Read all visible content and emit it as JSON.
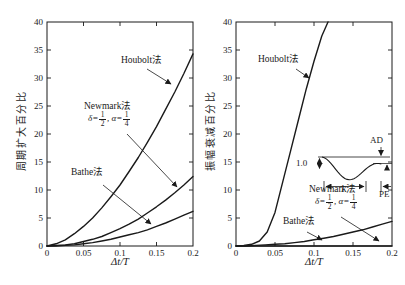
{
  "figure": {
    "bg": "#ffffff",
    "ink": "#1a1a1a",
    "width": 405,
    "height": 285
  },
  "labels": {
    "left": {
      "houbolt": "Houbolt法",
      "newmark": "Newmark法",
      "bathe": "Bathe法"
    },
    "right": {
      "houbolt": "Houbolt法",
      "newmark": "Newmark法",
      "bathe": "Bathe法"
    },
    "params": {
      "pre": "δ=",
      "f1n": "1",
      "f1d": "2",
      "mid": ", α=",
      "f2n": "1",
      "f2d": "4"
    }
  },
  "chart_data": [
    {
      "id": "period-elongation",
      "type": "line",
      "title": "",
      "xlabel": "Δt/T",
      "ylabel": "周期扩大百分比",
      "xlim": [
        0,
        0.2
      ],
      "ylim": [
        0,
        40
      ],
      "grid": false,
      "xticks": {
        "values": [
          0,
          0.05,
          0.1,
          0.15,
          0.2
        ],
        "labels": [
          "0",
          "0.05",
          "0.1",
          "0.15",
          "0.2"
        ]
      },
      "yticks": {
        "values": [
          0,
          5,
          10,
          15,
          20,
          25,
          30,
          35,
          40
        ],
        "labels": [
          "0",
          "5",
          "10",
          "15",
          "20",
          "25",
          "30",
          "35",
          "40"
        ]
      },
      "series": [
        {
          "key": "houbolt",
          "name": "Houbolt法",
          "x": [
            0,
            0.0125,
            0.025,
            0.0375,
            0.05,
            0.0625,
            0.075,
            0.0875,
            0.1,
            0.1125,
            0.125,
            0.1375,
            0.15,
            0.1625,
            0.175,
            0.1875,
            0.2
          ],
          "y": [
            0,
            0.4,
            1.1,
            2.2,
            3.5,
            5,
            6.8,
            8.8,
            10.9,
            13.3,
            15.8,
            18.5,
            21.3,
            24.4,
            27.5,
            30.8,
            34.3
          ]
        },
        {
          "key": "newmark",
          "name": "Newmark法 (δ=1/2, α=1/4)",
          "x": [
            0,
            0.0125,
            0.025,
            0.0375,
            0.05,
            0.0625,
            0.075,
            0.0875,
            0.1,
            0.1125,
            0.125,
            0.1375,
            0.15,
            0.1625,
            0.175,
            0.1875,
            0.2
          ],
          "y": [
            0,
            0.1,
            0.2,
            0.4,
            0.8,
            1.2,
            1.7,
            2.4,
            3.1,
            3.9,
            4.8,
            5.9,
            7,
            8.2,
            9.5,
            10.9,
            12.4
          ]
        },
        {
          "key": "bathe",
          "name": "Bathe法",
          "x": [
            0,
            0.0125,
            0.025,
            0.0375,
            0.05,
            0.0625,
            0.075,
            0.0875,
            0.1,
            0.1125,
            0.125,
            0.1375,
            0.15,
            0.1625,
            0.175,
            0.1875,
            0.2
          ],
          "y": [
            0,
            0,
            0.1,
            0.2,
            0.4,
            0.6,
            0.9,
            1.2,
            1.6,
            2,
            2.4,
            2.9,
            3.5,
            4.1,
            4.8,
            5.5,
            6.2
          ]
        }
      ],
      "annotations": [
        {
          "target": "houbolt",
          "from": [
            147,
            69
          ],
          "to": [
            171,
            84
          ]
        },
        {
          "target": "newmark",
          "from": [
            127,
            134
          ],
          "to": [
            177,
            187
          ]
        },
        {
          "target": "bathe",
          "from": [
            103,
            185
          ],
          "to": [
            151,
            224
          ]
        }
      ]
    },
    {
      "id": "amplitude-decay",
      "type": "line",
      "title": "",
      "xlabel": "Δt/T",
      "ylabel": "振幅衰减百分比",
      "xlim": [
        0,
        0.2
      ],
      "ylim": [
        0,
        40
      ],
      "grid": false,
      "xticks": {
        "values": [
          0,
          0.05,
          0.1,
          0.15,
          0.2
        ],
        "labels": [
          "0",
          "0.05",
          "0.1",
          "0.15",
          "0.2"
        ]
      },
      "yticks": {
        "values": [
          0,
          5,
          10,
          15,
          20,
          25,
          30,
          35,
          40
        ],
        "labels": [
          "0",
          "5",
          "10",
          "15",
          "20",
          "25",
          "30",
          "35",
          "40"
        ]
      },
      "series": [
        {
          "key": "houbolt",
          "name": "Houbolt法",
          "x": [
            0,
            0.01,
            0.02,
            0.03,
            0.04,
            0.05,
            0.06,
            0.07,
            0.08,
            0.09,
            0.1,
            0.11,
            0.118
          ],
          "y": [
            0,
            0.1,
            0.3,
            0.9,
            2.5,
            6,
            11.5,
            17,
            22.5,
            28,
            33,
            37.5,
            40
          ]
        },
        {
          "key": "newmark",
          "name": "Newmark法 (δ=1/2, α=1/4)",
          "x": [
            0,
            0.05,
            0.1,
            0.15,
            0.2
          ],
          "y": [
            0,
            0,
            0,
            0,
            0
          ]
        },
        {
          "key": "bathe",
          "name": "Bathe法",
          "x": [
            0,
            0.0125,
            0.025,
            0.0375,
            0.05,
            0.0625,
            0.075,
            0.0875,
            0.1,
            0.1125,
            0.125,
            0.1375,
            0.15,
            0.1625,
            0.175,
            0.1875,
            0.2
          ],
          "y": [
            0,
            0,
            0.1,
            0.2,
            0.3,
            0.4,
            0.6,
            0.8,
            1.1,
            1.4,
            1.7,
            2.1,
            2.5,
            2.9,
            3.4,
            3.9,
            4.4
          ]
        }
      ],
      "annotations": [
        {
          "target": "houbolt",
          "from": [
            296,
            69
          ],
          "to": [
            309,
            78
          ]
        },
        {
          "target": "newmark",
          "from": [
            341,
            217
          ],
          "to": [
            379,
            241
          ]
        },
        {
          "target": "bathe",
          "from": [
            307,
            232
          ],
          "to": [
            322,
            240
          ]
        }
      ],
      "inset": {
        "ad_label": "AD",
        "amplitude_label": "1.0",
        "period_label": "T",
        "pe_label": "PE"
      }
    }
  ]
}
